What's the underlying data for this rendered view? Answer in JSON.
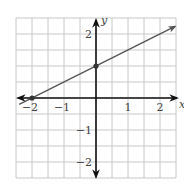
{
  "chart_data": {
    "type": "line",
    "title": "",
    "xlabel": "x",
    "ylabel": "y",
    "xlim": [
      -2.5,
      2.5
    ],
    "ylim": [
      -2.5,
      2.5
    ],
    "grid": true,
    "grid_step": 0.5,
    "x_ticks": [
      -2,
      -1,
      1,
      2
    ],
    "x_tick_labels": [
      "−2",
      "−1",
      "1",
      "2"
    ],
    "y_ticks": [
      2,
      -1,
      -2
    ],
    "y_tick_labels": [
      "2",
      "−1",
      "−2"
    ],
    "series": [
      {
        "name": "y = 0.5x + 1",
        "slope": 0.5,
        "intercept": 1,
        "x": [
          -2.4,
          2.47
        ],
        "y": [
          -0.2,
          2.235
        ],
        "arrow_end": true
      }
    ],
    "points": [
      {
        "x": -2,
        "y": 0
      },
      {
        "x": 0,
        "y": 1
      }
    ],
    "colors": {
      "grid": "#c8c8c8",
      "axes": "#111111",
      "line": "#555555",
      "points": "#333333"
    }
  }
}
